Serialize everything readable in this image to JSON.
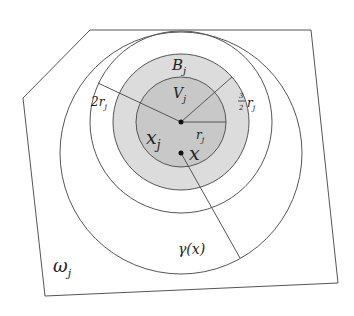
{
  "labels": {
    "omega": "ω",
    "omega_sub": "j",
    "B": "B",
    "B_sub": "j",
    "V": "V",
    "V_sub": "j",
    "two_r": "2r",
    "two_r_sub": "j",
    "three_half_num": "3",
    "three_half_den": "2",
    "three_half_r": "r",
    "three_half_sub": "j",
    "r": "r",
    "r_sub": "j",
    "xj": "x",
    "xj_sub": "j",
    "x": "x",
    "gamma": "γ(x)"
  },
  "colors": {
    "stroke": "#555555",
    "inner_fill": "#c8c8c8",
    "ring_fill": "#dcdcdc",
    "background": "#ffffff"
  }
}
